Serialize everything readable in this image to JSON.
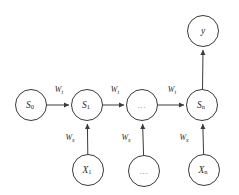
{
  "diagram": {
    "type": "unrolled-recurrent-neural-network-graph",
    "background_color": "#ffffff",
    "stroke_color": "#3a3a3a",
    "text_color": "#2b2b2b",
    "muted_text_color": "#7d7d7d",
    "nodes": [
      {
        "id": "s0",
        "base": "S",
        "sub": "0",
        "full": "S0",
        "cx": 31,
        "cy": 105,
        "r": 15.5,
        "style": "plain"
      },
      {
        "id": "s1",
        "base": "S",
        "sub": "1",
        "full": "S1",
        "cx": 87,
        "cy": 105,
        "r": 15.5,
        "style": "plain"
      },
      {
        "id": "smid",
        "base": "",
        "sub": "",
        "full": "...",
        "cx": 142,
        "cy": 105,
        "r": 15.5,
        "style": "ellipsis"
      },
      {
        "id": "sn",
        "base": "S",
        "sub": "n",
        "full": "Sn",
        "cx": 202,
        "cy": 105,
        "r": 15.5,
        "style": "plain"
      },
      {
        "id": "y",
        "base": "y",
        "sub": "",
        "full": "y",
        "cx": 203,
        "cy": 31,
        "r": 15.5,
        "style": "plain"
      },
      {
        "id": "x1",
        "base": "X",
        "sub": "1",
        "full": "X1",
        "cx": 88,
        "cy": 170,
        "r": 15.5,
        "style": "plain"
      },
      {
        "id": "xmid",
        "base": "",
        "sub": "",
        "full": "...",
        "cx": 144,
        "cy": 171,
        "r": 15.5,
        "style": "ellipsis"
      },
      {
        "id": "xn",
        "base": "X",
        "sub": "n",
        "full": "Xn",
        "cx": 204,
        "cy": 170,
        "r": 15.5,
        "style": "plain"
      }
    ],
    "edges": [
      {
        "id": "e-s0-s1",
        "from": "s0",
        "to": "s1",
        "direction": "right",
        "label_base": "W",
        "label_sub": "t",
        "label_full": "Wt",
        "lx": 59,
        "ly": 92
      },
      {
        "id": "e-s1-smid",
        "from": "s1",
        "to": "smid",
        "direction": "right",
        "label_base": "W",
        "label_sub": "t",
        "label_full": "Wt",
        "lx": 115,
        "ly": 92
      },
      {
        "id": "e-smid-sn",
        "from": "smid",
        "to": "sn",
        "direction": "right",
        "label_base": "W",
        "label_sub": "t",
        "label_full": "Wt",
        "lx": 172,
        "ly": 92
      },
      {
        "id": "e-sn-y",
        "from": "sn",
        "to": "y",
        "direction": "up",
        "label_base": "",
        "label_sub": "",
        "label_full": "",
        "lx": 0,
        "ly": 0
      },
      {
        "id": "e-x1-s1",
        "from": "x1",
        "to": "s1",
        "direction": "up",
        "label_base": "W",
        "label_sub": "x",
        "label_full": "Wx",
        "lx": 70,
        "ly": 140
      },
      {
        "id": "e-xmid-smid",
        "from": "xmid",
        "to": "smid",
        "direction": "up",
        "label_base": "W",
        "label_sub": "x",
        "label_full": "Wx",
        "lx": 126,
        "ly": 140
      },
      {
        "id": "e-xn-sn",
        "from": "xn",
        "to": "sn",
        "direction": "up",
        "label_base": "W",
        "label_sub": "x",
        "label_full": "Wx",
        "lx": 184,
        "ly": 140
      }
    ]
  }
}
